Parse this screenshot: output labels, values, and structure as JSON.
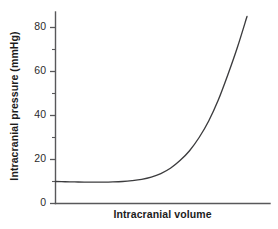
{
  "chart_data": {
    "type": "line",
    "title": "",
    "xlabel": "Intracranial volume",
    "ylabel": "Intracranial pressure (mmHg)",
    "ylim": [
      0,
      88
    ],
    "xlim": [
      0,
      100
    ],
    "grid": false,
    "legend": "none",
    "y_ticks_major": [
      0,
      20,
      40,
      60,
      80
    ],
    "y_ticks_minor": [
      10,
      30,
      50,
      70
    ],
    "y_tick_labels": [
      "0",
      "20",
      "40",
      "60",
      "80"
    ],
    "x_ticks": [],
    "x_tick_labels": [],
    "series": [
      {
        "name": "Intracranial pressure-volume curve",
        "x": [
          0,
          5,
          10,
          15,
          20,
          25,
          30,
          35,
          40,
          45,
          50,
          55,
          60,
          65,
          70,
          75,
          80,
          85,
          90,
          95,
          100
        ],
        "y": [
          10.0,
          9.9,
          9.8,
          9.7,
          9.7,
          9.7,
          9.8,
          10.0,
          10.4,
          11.0,
          12.0,
          13.6,
          16.0,
          19.5,
          24.0,
          30.0,
          37.5,
          47.0,
          58.5,
          71.0,
          85.0
        ],
        "color": "#3c3c3e"
      }
    ],
    "annotations": []
  },
  "axes": {
    "axis_color": "#58585a",
    "curve_color": "#3c3c3e",
    "background": "#ffffff"
  }
}
